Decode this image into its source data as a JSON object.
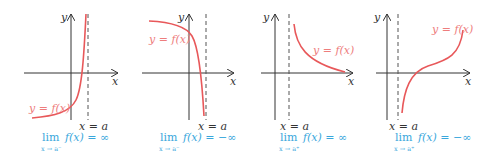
{
  "figure": {
    "panels": [
      {
        "function_label": "y = f(x)",
        "asymptote_label": "x = a",
        "axis_x_label": "x",
        "axis_y_label": "y",
        "limit_text": "lim",
        "limit_sub": "x → a⁻",
        "limit_expr": "f(x) = ∞",
        "behavior": "increases to +∞ approaching a from the left"
      },
      {
        "function_label": "y = f(x)",
        "asymptote_label": "x = a",
        "axis_x_label": "x",
        "axis_y_label": "y",
        "limit_text": "lim",
        "limit_sub": "x → a⁻",
        "limit_expr": "f(x) = −∞",
        "behavior": "decreases to −∞ approaching a from the left"
      },
      {
        "function_label": "y = f(x)",
        "asymptote_label": "x = a",
        "axis_x_label": "x",
        "axis_y_label": "y",
        "limit_text": "lim",
        "limit_sub": "x → a⁺",
        "limit_expr": "f(x) = ∞",
        "behavior": "increases to +∞ approaching a from the right"
      },
      {
        "function_label": "y = f(x)",
        "asymptote_label": "x = a",
        "axis_x_label": "x",
        "axis_y_label": "y",
        "limit_text": "lim",
        "limit_sub": "x → a⁺",
        "limit_expr": "f(x) = −∞",
        "behavior": "decreases to −∞ approaching a from the right"
      }
    ],
    "colors": {
      "curve": "#e8585a",
      "function_label": "#ee7d7d",
      "limit_text": "#3aa7dc",
      "axes": "#333333",
      "asymptote": "#555555"
    }
  }
}
